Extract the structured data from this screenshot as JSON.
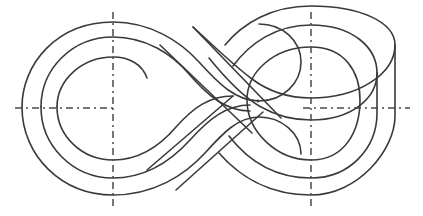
{
  "figure": {
    "kind": "engineering-line-drawing",
    "canvas": {
      "width": 423,
      "height": 216,
      "background": "#ffffff"
    }
  },
  "style": {
    "curve_color": "#3a3a3a",
    "curve_width": 1.6,
    "centerline_color": "#4a4a4a",
    "centerline_width": 1.5,
    "centerline_dash": "7 4 2 4",
    "dot_color": "#3a3a3a"
  },
  "chart_data": {
    "type": "line",
    "xlabel": "",
    "ylabel": "",
    "xlim": [
      0,
      423
    ],
    "ylim": [
      0,
      216
    ],
    "grid": false,
    "legend": "none",
    "annotations": [
      "three nested figure-eight turns of a continuous spiral",
      "free inner end terminates inside the left loop",
      "free outer end terminates above the central crossing",
      "dash-dot horizontal axis and two dash-dot vertical axes"
    ],
    "series": [
      {
        "name": "turn-1-outer",
        "role": "outermost spiral turn",
        "path": "M 193 27 L 253 89 C 268 103 284 109 302 109 C 346 109 379 86 379 52 C 379 24 352 6 313 6 C 266 6 228 28 205 59 C 182 90 164 119 131 119 C 94 119 68 99 68 70 C 68 38 100 18 140 18 C 171 18 193 27 193 27"
      },
      {
        "name": "turn-2-middle",
        "role": "middle spiral turn",
        "path": "M 147 78 C 126 78 110 90 110 107 C 110 126 128 139 151 139 C 178 139 203 119 219 98 C 241 69 272 41 308 41 C 339 41 362 59 362 84 C 362 111 338 131 307 131 C 281 131 262 120 245 103 L 160 18"
      },
      {
        "name": "turn-3-inner",
        "role": "innermost spiral turn",
        "path": "M 175 12 L 248 85 C 266 102 288 112 311 112 C 351 112 383 86 383 51 C 383 20 352 1 310 1"
      }
    ],
    "centerlines": [
      {
        "name": "horizontal-axis-left",
        "orientation": "horizontal",
        "x1": 15,
        "y1": 108,
        "x2": 117,
        "y2": 108
      },
      {
        "name": "horizontal-axis-right",
        "orientation": "horizontal",
        "x1": 303,
        "y1": 108,
        "x2": 410,
        "y2": 108
      },
      {
        "name": "vertical-axis-left",
        "orientation": "vertical",
        "x1": 113,
        "y1": 12,
        "x2": 113,
        "y2": 206
      },
      {
        "name": "vertical-axis-right",
        "orientation": "vertical",
        "x1": 311,
        "y1": 12,
        "x2": 311,
        "y2": 206
      }
    ],
    "markers": [
      {
        "name": "right-loop-center-dot",
        "x": 258,
        "y": 101,
        "r": 1.4
      }
    ],
    "endpoints": [
      {
        "name": "inner-free-end",
        "x": 147,
        "y": 78,
        "note": "open end of innermost turn in left loop"
      },
      {
        "name": "outer-free-end",
        "x": 193,
        "y": 27,
        "note": "open end rising above central crossing"
      }
    ]
  }
}
